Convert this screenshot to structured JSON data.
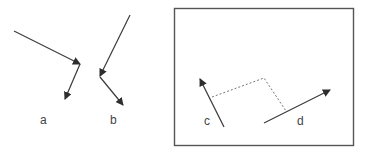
{
  "labels": {
    "a": "a",
    "b": "b",
    "c": "c",
    "d": "d"
  },
  "colors": {
    "stroke": "#3a3a3a",
    "box": "#555555",
    "dashed": "#666666",
    "text": "#444444"
  }
}
